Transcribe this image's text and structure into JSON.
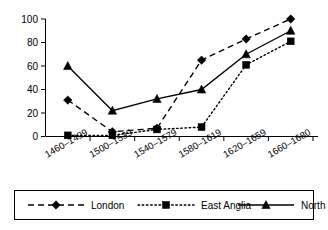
{
  "chart_data": {
    "type": "line",
    "title": "",
    "subtitle": "",
    "xlabel": "",
    "ylabel": "",
    "categories": [
      "1460–1499",
      "1500–1539",
      "1540–1579",
      "1580–1619",
      "1620–1659",
      "1660–1680"
    ],
    "ylim": [
      0,
      100
    ],
    "yticks": [
      0,
      20,
      40,
      60,
      80,
      100
    ],
    "ytick_labels": [
      "0",
      "20",
      "40",
      "60",
      "80",
      "100"
    ],
    "grid": false,
    "legend_position": "bottom",
    "series": [
      {
        "name": "London",
        "values": [
          31,
          4,
          7,
          65,
          83,
          100
        ],
        "line_style": "dashed",
        "marker": "diamond",
        "color": "#000000"
      },
      {
        "name": "East Anglia",
        "values": [
          1,
          1,
          6,
          8,
          61,
          81
        ],
        "line_style": "dotted",
        "marker": "square",
        "color": "#000000"
      },
      {
        "name": "North",
        "values": [
          60,
          22,
          32,
          40,
          70,
          90
        ],
        "line_style": "solid",
        "marker": "triangle",
        "color": "#000000"
      }
    ]
  },
  "legend": {
    "items": [
      {
        "label": "London"
      },
      {
        "label": "East Anglia"
      },
      {
        "label": "North"
      }
    ]
  }
}
